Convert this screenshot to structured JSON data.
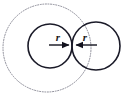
{
  "figure": {
    "background_color": "#ffffff",
    "width": 132,
    "height": 105
  },
  "labels": {
    "left_radius": "r",
    "right_radius": "r"
  },
  "chart_data": {
    "type": "diagram",
    "shapes": [
      {
        "name": "outer-dashed-circle",
        "kind": "circle",
        "center": [
          47,
          48
        ],
        "radius": 44,
        "stroke": "#8a8a96",
        "stroke_width": 1,
        "stroke_style": "dotted",
        "fill": "none"
      },
      {
        "name": "left-circle",
        "kind": "circle",
        "center": [
          50,
          46
        ],
        "radius": 22,
        "stroke": "#1a1a28",
        "stroke_width": 1.6,
        "stroke_style": "solid",
        "fill": "none"
      },
      {
        "name": "right-circle",
        "kind": "circle",
        "center": [
          96,
          46
        ],
        "radius": 24,
        "stroke": "#1a1a28",
        "stroke_width": 1.6,
        "stroke_style": "solid",
        "fill": "none"
      },
      {
        "name": "left-radius-arrow",
        "kind": "arrow",
        "from": [
          49,
          45
        ],
        "to": [
          71,
          45
        ],
        "stroke": "#12121e",
        "stroke_width": 1.4,
        "arrowhead": "end"
      },
      {
        "name": "right-radius-arrow",
        "kind": "arrow",
        "from": [
          97,
          45
        ],
        "to": [
          74,
          45
        ],
        "stroke": "#12121e",
        "stroke_width": 1.4,
        "arrowhead": "end"
      }
    ],
    "annotations": [
      {
        "name": "left-radius-label",
        "text": "r",
        "position": [
          58,
          38
        ],
        "style": "italic-bold"
      },
      {
        "name": "right-radius-label",
        "text": "r",
        "position": [
          85,
          38
        ],
        "style": "italic-bold"
      }
    ],
    "colors": {
      "outer_circle": "#8a8a96",
      "solid_circles": "#1a1a28",
      "arrows": "#12121e",
      "text": "#1a1a1a",
      "background": "#ffffff"
    }
  }
}
